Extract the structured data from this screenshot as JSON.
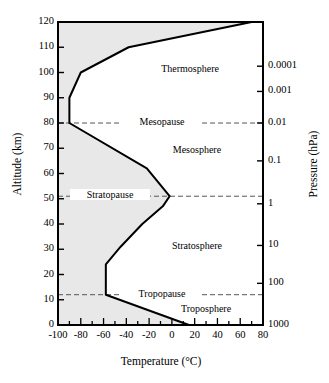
{
  "chart_data": {
    "type": "line",
    "title": "",
    "xlabel": "Temperature (°C)",
    "ylabel": "Altitude (km)",
    "y2label": "Pressure (hPa)",
    "xlim": [
      -100,
      80
    ],
    "ylim": [
      0,
      120
    ],
    "xticks": [
      -100,
      -80,
      -60,
      -40,
      -20,
      0,
      20,
      40,
      60,
      80
    ],
    "xticklabels": [
      "-100",
      "-80",
      "-60",
      "-40",
      "-20",
      "0",
      "20",
      "40",
      "60",
      "80"
    ],
    "xminorstep": 10,
    "yticks": [
      0,
      10,
      20,
      30,
      40,
      50,
      60,
      70,
      80,
      90,
      100,
      110,
      120
    ],
    "yticklabels": [
      "0",
      "10",
      "20",
      "30",
      "40",
      "50",
      "60",
      "70",
      "80",
      "90",
      "100",
      "110",
      "120"
    ],
    "pressure_ticks": [
      {
        "label": "0.0001",
        "altitude_km": 102.5
      },
      {
        "label": "0.001",
        "altitude_km": 92.5
      },
      {
        "label": "0.01",
        "altitude_km": 80.0
      },
      {
        "label": "0.1",
        "altitude_km": 65.0
      },
      {
        "label": "1",
        "altitude_km": 48.0
      },
      {
        "label": "10",
        "altitude_km": 31.5
      },
      {
        "label": "100",
        "altitude_km": 16.5
      },
      {
        "label": "1000",
        "altitude_km": 0.0
      }
    ],
    "pressure_scale": "log",
    "grid": false,
    "legend": "none",
    "fill_side": "left",
    "fill_color": "#e8e8e8",
    "line_color": "#000000",
    "series": [
      {
        "name": "Standard atmosphere temperature profile",
        "points": [
          {
            "t": 15,
            "z": 0
          },
          {
            "t": -58,
            "z": 12
          },
          {
            "t": -58,
            "z": 24
          },
          {
            "t": -45,
            "z": 31
          },
          {
            "t": -26,
            "z": 40
          },
          {
            "t": -8,
            "z": 47
          },
          {
            "t": -2,
            "z": 51
          },
          {
            "t": -22,
            "z": 62
          },
          {
            "t": -90,
            "z": 80
          },
          {
            "t": -90,
            "z": 90
          },
          {
            "t": -80,
            "z": 100
          },
          {
            "t": -38,
            "z": 110
          },
          {
            "t": 70,
            "z": 120
          }
        ]
      }
    ],
    "boundaries": [
      {
        "name": "Tropopause",
        "altitude_km": 12,
        "style": "dashed"
      },
      {
        "name": "Stratopause",
        "altitude_km": 51,
        "style": "dashed"
      },
      {
        "name": "Mesopause",
        "altitude_km": 80,
        "style": "dashed"
      }
    ],
    "layers": [
      {
        "name": "Troposphere",
        "label_altitude_km": 6,
        "label_temperature_c": 30
      },
      {
        "name": "Stratosphere",
        "label_altitude_km": 31,
        "label_temperature_c": 22
      },
      {
        "name": "Mesosphere",
        "label_altitude_km": 69,
        "label_temperature_c": 22
      },
      {
        "name": "Thermosphere",
        "label_altitude_km": 101,
        "label_temperature_c": 16
      }
    ]
  },
  "axes": {
    "x_title": "Temperature (°C)",
    "y_left_title": "Altitude (km)",
    "y_right_title": "Pressure (hPa)"
  }
}
